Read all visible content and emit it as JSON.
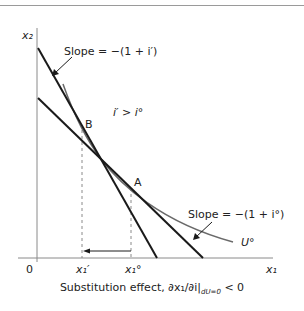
{
  "diagram": {
    "axes": {
      "y_label": "x₂",
      "x_label": "x₁",
      "origin_label": "0"
    },
    "annotations": {
      "slope_steep": "Slope = −(1 + i′)",
      "slope_shallow": "Slope = −(1 + i°)",
      "inequality": "i′ > i°",
      "point_b": "B",
      "point_a": "A",
      "curve_label": "U°",
      "tick_x1_prime": "x₁′",
      "tick_x1_zero": "x₁°"
    },
    "caption": "Substitution effect, ∂x₁/∂i|",
    "caption_subscript": "dU=0",
    "caption_tail": "< 0",
    "colors": {
      "line": "#1a1a1a",
      "curve": "#6a6a6a",
      "axis": "#8a8a8a",
      "dashed": "#8a8a8a"
    }
  }
}
